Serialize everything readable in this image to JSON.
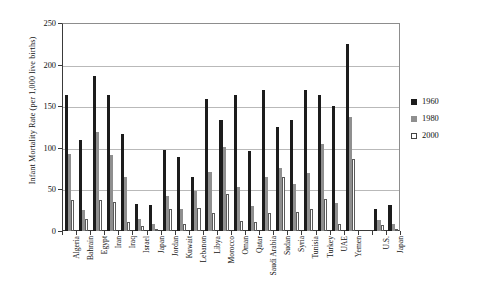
{
  "chart_data": {
    "type": "bar",
    "title": "",
    "xlabel": "",
    "ylabel": "Infant Mortality Rate (per 1,000 live births)",
    "ylim": [
      0,
      250
    ],
    "yticks": [
      0,
      50,
      100,
      150,
      200,
      250
    ],
    "grid": true,
    "legend_position": "right",
    "categories": [
      "Algeria",
      "Bahrain",
      "Egypt",
      "Iran",
      "Iraq",
      "Israel",
      "Japan",
      "Jordan",
      "Kuwait",
      "Lebanon",
      "Libya",
      "Morocco",
      "Oman",
      "Qatar",
      "Saudi Arabia",
      "Sudan",
      "Syria",
      "Tunisia",
      "Turkey",
      "UAE",
      "Yemen",
      "",
      "U.S.",
      "Japan"
    ],
    "series": [
      {
        "name": "1960",
        "color": "#1c1c1c",
        "values": [
          163,
          109,
          186,
          164,
          117,
          32,
          31,
          97,
          89,
          65,
          159,
          133,
          164,
          96,
          170,
          125,
          133,
          170,
          163,
          150,
          225,
          null,
          26,
          31
        ]
      },
      {
        "name": "1980",
        "color": "#8f8f8f",
        "values": [
          93,
          25,
          119,
          91,
          65,
          15,
          8,
          42,
          27,
          48,
          71,
          101,
          53,
          30,
          65,
          76,
          56,
          70,
          105,
          34,
          137,
          null,
          13,
          8
        ]
      },
      {
        "name": "2000",
        "color": "#ffffff",
        "values": [
          37,
          15,
          37,
          35,
          11,
          6,
          3,
          26,
          9,
          28,
          22,
          45,
          12,
          11,
          22,
          65,
          23,
          27,
          39,
          8,
          86,
          null,
          7,
          3
        ]
      }
    ]
  },
  "legend": {
    "items": [
      {
        "label": "1960"
      },
      {
        "label": "1980"
      },
      {
        "label": "2000"
      }
    ]
  }
}
